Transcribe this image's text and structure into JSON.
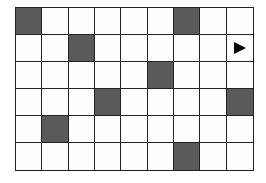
{
  "grid": {
    "rows": 6,
    "cols": 9,
    "shaded_color": "#5a5a5a",
    "line_color": "#222222",
    "shaded_cells": [
      [
        0,
        0
      ],
      [
        0,
        6
      ],
      [
        1,
        2
      ],
      [
        2,
        5
      ],
      [
        3,
        3
      ],
      [
        3,
        8
      ],
      [
        4,
        1
      ],
      [
        5,
        6
      ]
    ],
    "markers": [
      {
        "row": 1,
        "col": 8,
        "type": "arrow-right-icon",
        "glyph": "▶"
      }
    ]
  }
}
